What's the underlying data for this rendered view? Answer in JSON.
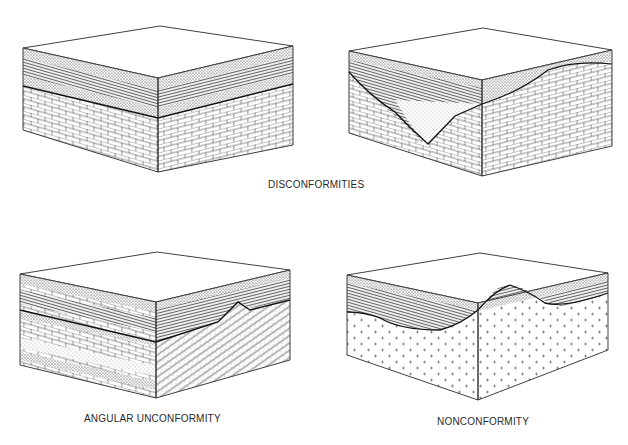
{
  "figure": {
    "captions": {
      "disconformities": "DISCONFORMITIES",
      "angular_unconformity": "ANGULAR UNCONFORMITY",
      "nonconformity": "NONCONFORMITY"
    },
    "blocks": [
      {
        "id": "disconformity-planar",
        "type": "disconformity",
        "description": "Layered sandstone/shale strata resting on a planar erosion surface above limestone",
        "lower_unit": "limestone",
        "upper_units": [
          "sandstone",
          "shale",
          "limestone",
          "sandstone"
        ]
      },
      {
        "id": "disconformity-channel",
        "type": "disconformity",
        "description": "Channel cut into limestone, filled with sandstone and layered strata",
        "lower_unit": "limestone",
        "upper_units": [
          "sandstone fill",
          "shale",
          "sandstone"
        ]
      },
      {
        "id": "angular-unconformity",
        "type": "angular_unconformity",
        "description": "Horizontal strata overlying tilted/folded older strata",
        "lower_unit": "tilted sandstone/shale",
        "upper_units": [
          "limestone",
          "shale",
          "sandstone"
        ]
      },
      {
        "id": "nonconformity",
        "type": "nonconformity",
        "description": "Sedimentary strata resting on eroded crystalline (igneous) rock",
        "lower_unit": "granite",
        "upper_units": [
          "sandstone",
          "shale",
          "limestone"
        ]
      }
    ],
    "colors": {
      "line": "#2a2a2a",
      "background": "#ffffff",
      "stipple": "#555555"
    }
  }
}
